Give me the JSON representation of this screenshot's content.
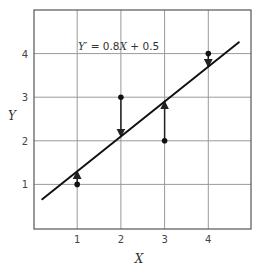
{
  "chart_data": {
    "type": "scatter",
    "title": "",
    "xlabel": "X",
    "ylabel": "Y",
    "xlim": [
      0,
      5
    ],
    "ylim": [
      0,
      5
    ],
    "grid": true,
    "x_ticks": [
      "1",
      "2",
      "3",
      "4"
    ],
    "y_ticks": [
      "1",
      "2",
      "3",
      "4"
    ],
    "series": [
      {
        "name": "observed",
        "type": "scatter",
        "x": [
          1,
          2,
          3,
          4
        ],
        "y": [
          1,
          3,
          2,
          4
        ]
      },
      {
        "name": "regression line",
        "type": "line",
        "x": [
          0.2,
          4.7
        ],
        "y": [
          0.66,
          4.26
        ]
      }
    ],
    "predicted": [
      1.3,
      2.1,
      2.9,
      3.7
    ],
    "residual_arrows": [
      {
        "x": 1,
        "from": 1,
        "to": 1.3
      },
      {
        "x": 2,
        "from": 3,
        "to": 2.1
      },
      {
        "x": 3,
        "from": 2,
        "to": 2.9
      },
      {
        "x": 4,
        "from": 4,
        "to": 3.7
      }
    ],
    "annotation": {
      "text": "Y′ = 0.8X + 0.5",
      "y_part": "Y′",
      "eq_a": " = 0.8",
      "x_part": "X",
      "eq_b": " + 0.5"
    }
  }
}
